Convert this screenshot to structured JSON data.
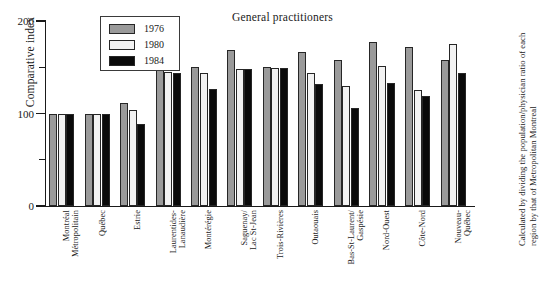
{
  "chart_data": {
    "type": "bar",
    "title": "General practitioners",
    "xlabel": "",
    "ylabel": "Comparative index",
    "ylim": [
      0,
      200
    ],
    "yticks": [
      0,
      50,
      100,
      150,
      200
    ],
    "ytick_labels": [
      "0",
      "",
      "100",
      "",
      "200"
    ],
    "grid": false,
    "legend_position": "top-left-inside",
    "categories": [
      "Montréal\nMétropolitain",
      "Québec",
      "Estrie",
      "Laurentides-\nLanaudière",
      "Montérégie",
      "Saguenay/\nLac St-Jean",
      "Trois-Rivières",
      "Outaouais",
      "Bas-St-Laurent/\nGaspésie",
      "Nord-Ouest",
      "Côte-Nord",
      "Nouveau-\nQuébec"
    ],
    "series": [
      {
        "name": "1976",
        "color": "#9a9a9a",
        "values": [
          100,
          100,
          111,
          158,
          150,
          169,
          150,
          166,
          158,
          177,
          172,
          158
        ]
      },
      {
        "name": "1980",
        "color": "#f2f2f2",
        "values": [
          100,
          100,
          104,
          145,
          144,
          148,
          149,
          144,
          130,
          151,
          125,
          175
        ]
      },
      {
        "name": "1984",
        "color": "#0a0a0a",
        "values": [
          100,
          100,
          89,
          144,
          127,
          148,
          149,
          132,
          106,
          133,
          119,
          144
        ]
      }
    ],
    "annotations": [
      "Calculated by dividing the population/physician ratio of each region by that of Metropolitan Montreal"
    ]
  },
  "legend": {
    "entries": [
      {
        "label": "1976",
        "swatch": "gray-swatch"
      },
      {
        "label": "1980",
        "swatch": "white-swatch"
      },
      {
        "label": "1984",
        "swatch": "black-swatch"
      }
    ]
  },
  "footnote": {
    "text": "Calculated by dividing the population/physician ratio of each region by that of Metropolitan Montreal"
  }
}
